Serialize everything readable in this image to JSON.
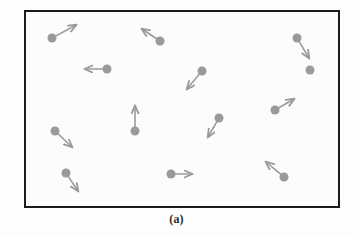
{
  "figure": {
    "caption": "(a)",
    "container_label": "gas-container",
    "colors": {
      "particle": "#9a9a9a",
      "vector": "#9a9a9a",
      "border": "#1c1c1c",
      "background": "#fcfcfb"
    }
  },
  "chart_data": {
    "type": "scatter",
    "title": "(a)",
    "subtitle": "",
    "xlabel": "",
    "ylabel": "",
    "grid": false,
    "legend": null,
    "xlim": [
      24,
      340
    ],
    "ylim": [
      10,
      208
    ],
    "annotations": [
      "(a)"
    ],
    "particle_count": 13,
    "particle_radius": 4.5,
    "series": [
      {
        "name": "particles-with-velocity-vectors",
        "points": [
          {
            "id": "p1",
            "x": 52,
            "y": 38,
            "vx": 24,
            "vy": -13,
            "direction": "up-right"
          },
          {
            "id": "p2",
            "x": 160,
            "y": 41,
            "vx": -18,
            "vy": -12,
            "direction": "up-left"
          },
          {
            "id": "p3",
            "x": 297,
            "y": 38,
            "vx": 12,
            "vy": 20,
            "direction": "down-right"
          },
          {
            "id": "p4",
            "x": 107,
            "y": 69,
            "vx": -22,
            "vy": 0,
            "direction": "left"
          },
          {
            "id": "p5",
            "x": 202,
            "y": 71,
            "vx": -15,
            "vy": 18,
            "direction": "down-left"
          },
          {
            "id": "p6",
            "x": 275,
            "y": 110,
            "vx": 19,
            "vy": -11,
            "direction": "up-right"
          },
          {
            "id": "p7",
            "x": 135,
            "y": 131,
            "vx": 0,
            "vy": -25,
            "direction": "up"
          },
          {
            "id": "p8",
            "x": 219,
            "y": 118,
            "vx": -11,
            "vy": 19,
            "direction": "down-left"
          },
          {
            "id": "p9",
            "x": 55,
            "y": 131,
            "vx": 17,
            "vy": 16,
            "direction": "down-right"
          },
          {
            "id": "p10",
            "x": 66,
            "y": 173,
            "vx": 12,
            "vy": 18,
            "direction": "down-right"
          },
          {
            "id": "p11",
            "x": 171,
            "y": 174,
            "vx": 21,
            "vy": 0,
            "direction": "right"
          },
          {
            "id": "p12",
            "x": 284,
            "y": 177,
            "vx": -18,
            "vy": -15,
            "direction": "up-left"
          },
          {
            "id": "p13",
            "x": 310,
            "y": 70,
            "vx": 0,
            "vy": 0,
            "direction": "none"
          }
        ]
      }
    ]
  }
}
